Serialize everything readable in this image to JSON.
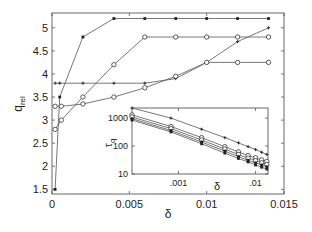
{
  "chart_data": [
    {
      "type": "line",
      "title": "",
      "xlabel": "δ",
      "ylabel": "q_rel",
      "xlim": [
        0,
        0.015
      ],
      "ylim": [
        1.4,
        5.32
      ],
      "xticks": [
        0,
        0.005,
        0.01,
        0.015
      ],
      "xtick_labels": [
        "0",
        "0.005",
        "0.01",
        "0.015"
      ],
      "yticks": [
        1.5,
        2,
        2.5,
        3,
        3.5,
        4,
        4.5,
        5
      ],
      "ytick_labels": [
        "1.5",
        "2",
        "2.5",
        "3",
        "3.5",
        "4",
        "4.5",
        "5"
      ],
      "grid": false,
      "legend": null,
      "series": [
        {
          "name": "filled markers (top)",
          "marker": "filled",
          "x": [
            0.0002,
            0.0005,
            0.002,
            0.004,
            0.006,
            0.008,
            0.01,
            0.012,
            0.014
          ],
          "y": [
            1.5,
            3.5,
            4.8,
            5.2,
            5.2,
            5.2,
            5.2,
            5.2,
            5.2
          ]
        },
        {
          "name": "open circles (upper)",
          "marker": "open-circle",
          "x": [
            0.0002,
            0.0006,
            0.002,
            0.004,
            0.006,
            0.008,
            0.01,
            0.012,
            0.014
          ],
          "y": [
            2.8,
            3.0,
            3.5,
            4.2,
            4.8,
            4.8,
            4.8,
            4.8,
            4.8
          ]
        },
        {
          "name": "small markers (rising)",
          "marker": "plus",
          "x": [
            0.0002,
            0.0005,
            0.002,
            0.004,
            0.006,
            0.008,
            0.01,
            0.012,
            0.014
          ],
          "y": [
            3.8,
            3.8,
            3.8,
            3.8,
            3.8,
            3.9,
            4.25,
            4.7,
            5.0
          ]
        },
        {
          "name": "open circles (lower)",
          "marker": "open-circle",
          "x": [
            0.0002,
            0.0006,
            0.002,
            0.004,
            0.006,
            0.008,
            0.01,
            0.012,
            0.014
          ],
          "y": [
            3.3,
            3.3,
            3.35,
            3.5,
            3.7,
            3.95,
            4.25,
            4.25,
            4.25
          ]
        }
      ]
    },
    {
      "type": "line",
      "title": "inset",
      "xlabel": "δ",
      "ylabel": "τ_q",
      "xscale": "log",
      "yscale": "log",
      "xlim": [
        0.00025,
        0.0145
      ],
      "ylim": [
        10,
        2300
      ],
      "xticks": [
        0.001,
        0.01
      ],
      "xtick_labels": [
        ".001",
        ".01"
      ],
      "yticks": [
        10,
        100,
        1000
      ],
      "ytick_labels": [
        "10",
        "100",
        "1000"
      ],
      "grid": false,
      "series": [
        {
          "name": "s1",
          "marker": "plus",
          "x": [
            0.00025,
            0.0008,
            0.002,
            0.004,
            0.006,
            0.008,
            0.01,
            0.012,
            0.014
          ],
          "y": [
            2300,
            1000,
            400,
            200,
            130,
            95,
            75,
            60,
            50
          ]
        },
        {
          "name": "s2",
          "marker": "open-circle",
          "x": [
            0.00025,
            0.0008,
            0.002,
            0.004,
            0.006,
            0.008,
            0.01,
            0.012,
            0.014
          ],
          "y": [
            1300,
            500,
            200,
            95,
            62,
            46,
            38,
            32,
            28
          ]
        },
        {
          "name": "s3",
          "marker": "open-circle",
          "x": [
            0.00025,
            0.0008,
            0.002,
            0.004,
            0.006,
            0.008,
            0.01,
            0.012,
            0.014
          ],
          "y": [
            1100,
            420,
            165,
            78,
            50,
            37,
            30,
            25,
            22
          ]
        },
        {
          "name": "s4",
          "marker": "filled",
          "x": [
            0.00025,
            0.0008,
            0.002,
            0.004,
            0.006,
            0.008,
            0.01,
            0.012,
            0.014
          ],
          "y": [
            950,
            360,
            140,
            66,
            42,
            31,
            25,
            21,
            18
          ]
        },
        {
          "name": "s5",
          "marker": "filled",
          "x": [
            0.00025,
            0.0008,
            0.002,
            0.004,
            0.006,
            0.008,
            0.01,
            0.012,
            0.014
          ],
          "y": [
            850,
            320,
            120,
            56,
            36,
            27,
            21,
            17.5,
            15
          ]
        }
      ]
    }
  ],
  "labels": {
    "main_xlabel": "δ",
    "main_ylabel_base": "q",
    "main_ylabel_sub": "rel",
    "inset_xlabel": "δ",
    "inset_ylabel_base": "τ",
    "inset_ylabel_sub": "q"
  }
}
